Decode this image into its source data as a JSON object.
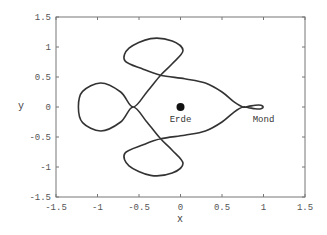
{
  "chart_data": {
    "type": "line",
    "title": "",
    "xlabel": "x",
    "ylabel": "y",
    "xlim": [
      -1.5,
      1.5
    ],
    "ylim": [
      -1.5,
      1.5
    ],
    "grid": false,
    "legend": null,
    "x_ticks": [
      "-1.5",
      "-1",
      "-0.5",
      "0",
      "0.5",
      "1",
      "1.5"
    ],
    "y_ticks": [
      "-1.5",
      "-1",
      "-0.5",
      "0",
      "0.5",
      "1",
      "1.5"
    ],
    "series": [
      {
        "name": "trajectory",
        "color": "#333333",
        "points": [
          [
            1.0,
            0.0
          ],
          [
            0.97,
            0.03
          ],
          [
            0.9,
            0.03
          ],
          [
            0.82,
            0.01
          ],
          [
            0.75,
            0.0
          ],
          [
            0.65,
            0.08
          ],
          [
            0.5,
            0.25
          ],
          [
            0.3,
            0.4
          ],
          [
            0.05,
            0.47
          ],
          [
            -0.24,
            0.53
          ],
          [
            -0.45,
            0.63
          ],
          [
            -0.67,
            0.77
          ],
          [
            -0.62,
            0.98
          ],
          [
            -0.36,
            1.14
          ],
          [
            -0.1,
            1.1
          ],
          [
            0.03,
            0.94
          ],
          [
            -0.1,
            0.72
          ],
          [
            -0.24,
            0.53
          ],
          [
            -0.4,
            0.26
          ],
          [
            -0.57,
            0.0
          ],
          [
            -0.72,
            0.25
          ],
          [
            -0.96,
            0.4
          ],
          [
            -1.18,
            0.26
          ],
          [
            -1.23,
            0.0
          ],
          [
            -1.18,
            -0.26
          ],
          [
            -0.96,
            -0.4
          ],
          [
            -0.72,
            -0.25
          ],
          [
            -0.57,
            0.0
          ],
          [
            -0.4,
            -0.26
          ],
          [
            -0.24,
            -0.53
          ],
          [
            -0.1,
            -0.72
          ],
          [
            0.03,
            -0.94
          ],
          [
            -0.1,
            -1.1
          ],
          [
            -0.36,
            -1.14
          ],
          [
            -0.62,
            -0.98
          ],
          [
            -0.67,
            -0.77
          ],
          [
            -0.45,
            -0.63
          ],
          [
            -0.24,
            -0.53
          ],
          [
            0.05,
            -0.47
          ],
          [
            0.3,
            -0.4
          ],
          [
            0.5,
            -0.25
          ],
          [
            0.65,
            -0.08
          ],
          [
            0.75,
            0.0
          ],
          [
            0.82,
            -0.01
          ],
          [
            0.9,
            -0.03
          ],
          [
            0.97,
            -0.03
          ],
          [
            1.0,
            0.0
          ]
        ]
      }
    ],
    "markers": [
      {
        "name": "Erde",
        "x": 0,
        "y": 0,
        "label": "Erde"
      }
    ],
    "annotations": [
      {
        "text": "Erde",
        "x": 0,
        "y": -0.2
      },
      {
        "text": "Mond",
        "x": 1.0,
        "y": -0.2
      }
    ]
  }
}
